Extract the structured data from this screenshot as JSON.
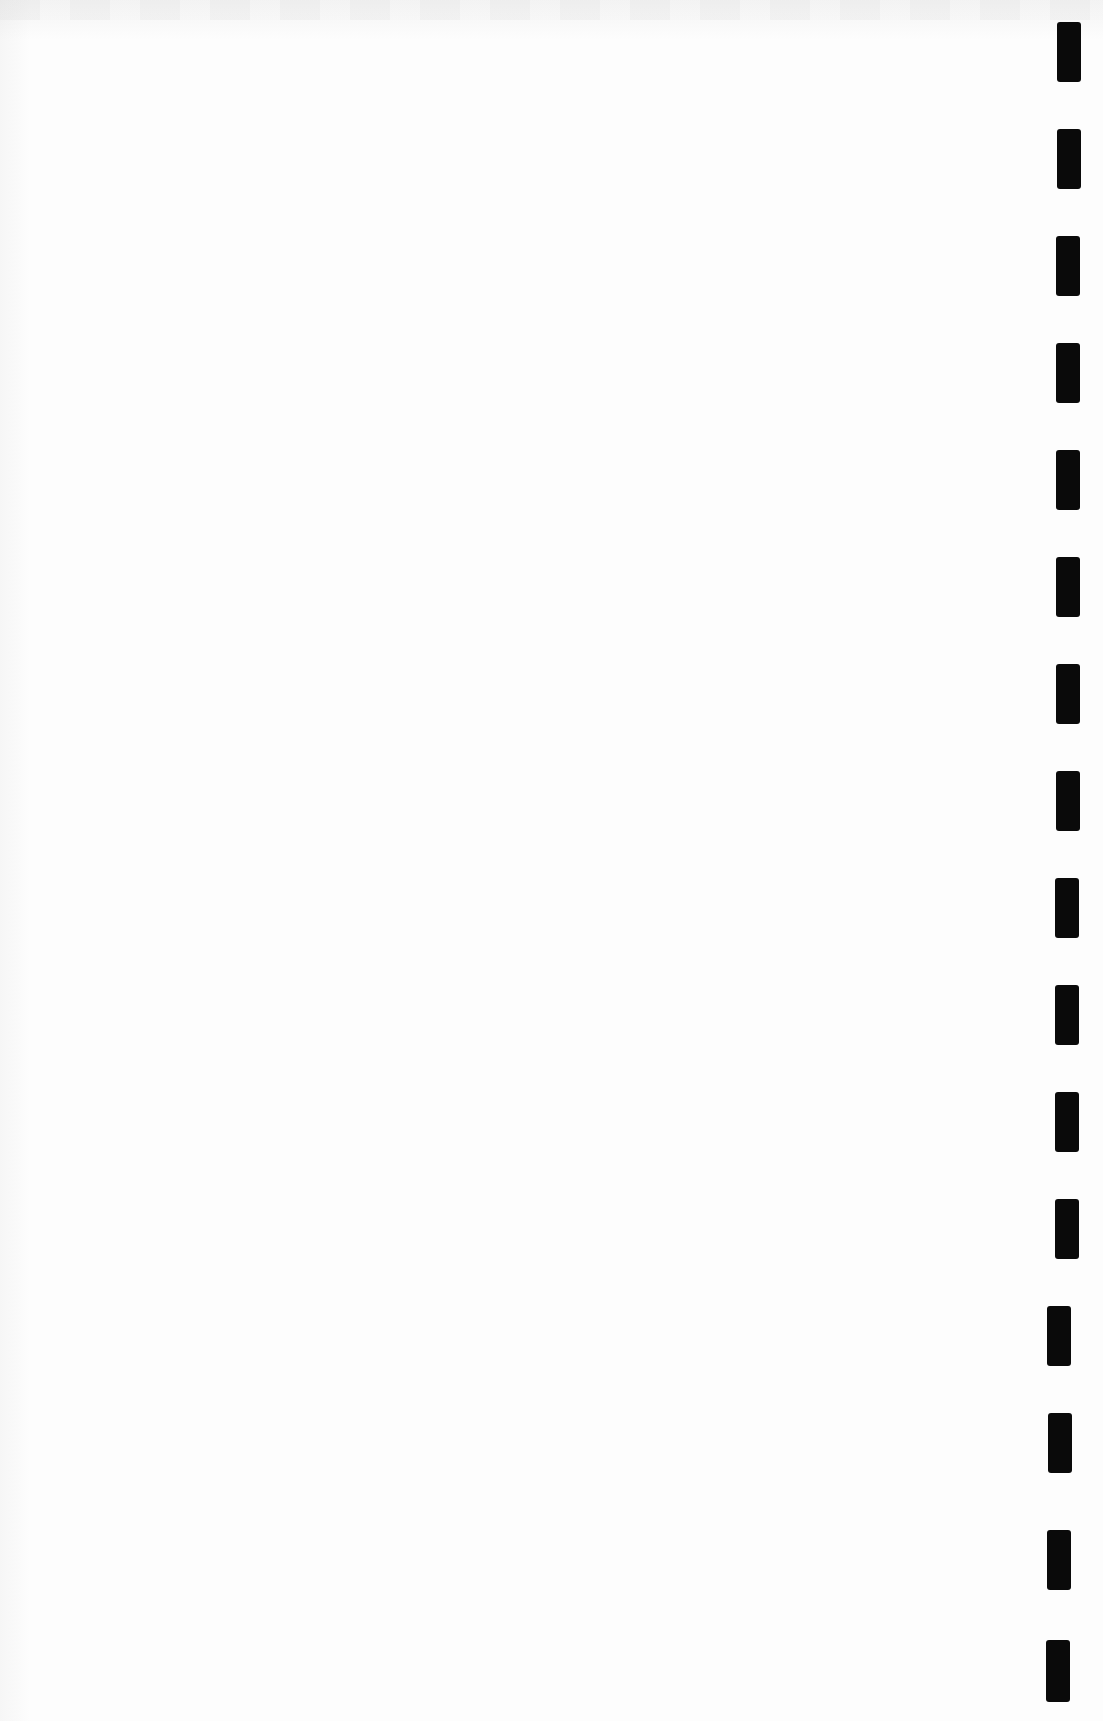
{
  "page": {
    "type": "blank scanned page",
    "background_color": "#fdfdfd",
    "text": ""
  },
  "binding_marks": {
    "color": "#0a0a0a",
    "count": 16,
    "items": [
      {
        "x": 1057,
        "y": 22,
        "w": 24,
        "h": 60
      },
      {
        "x": 1057,
        "y": 129,
        "w": 24,
        "h": 60
      },
      {
        "x": 1056,
        "y": 236,
        "w": 24,
        "h": 60
      },
      {
        "x": 1056,
        "y": 343,
        "w": 24,
        "h": 60
      },
      {
        "x": 1056,
        "y": 450,
        "w": 24,
        "h": 60
      },
      {
        "x": 1056,
        "y": 557,
        "w": 24,
        "h": 60
      },
      {
        "x": 1056,
        "y": 664,
        "w": 24,
        "h": 60
      },
      {
        "x": 1056,
        "y": 771,
        "w": 24,
        "h": 60
      },
      {
        "x": 1055,
        "y": 878,
        "w": 24,
        "h": 60
      },
      {
        "x": 1055,
        "y": 985,
        "w": 24,
        "h": 60
      },
      {
        "x": 1055,
        "y": 1092,
        "w": 24,
        "h": 60
      },
      {
        "x": 1055,
        "y": 1199,
        "w": 24,
        "h": 60
      },
      {
        "x": 1047,
        "y": 1306,
        "w": 24,
        "h": 60
      },
      {
        "x": 1048,
        "y": 1413,
        "w": 24,
        "h": 60
      },
      {
        "x": 1047,
        "y": 1530,
        "w": 24,
        "h": 60
      },
      {
        "x": 1046,
        "y": 1640,
        "w": 24,
        "h": 62
      }
    ]
  }
}
